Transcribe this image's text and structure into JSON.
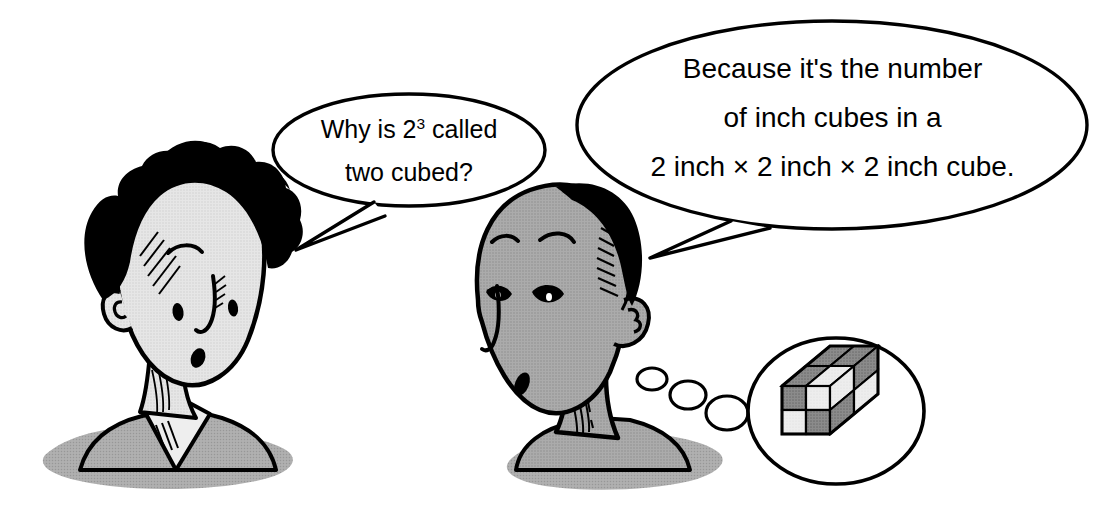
{
  "scene": {
    "title": "Two cubed cartoon explanation",
    "background_color": "#ffffff",
    "width": 1102,
    "height": 507
  },
  "palette": {
    "ink": "#000000",
    "paper": "#ffffff",
    "skin_light": "#e2e2e2",
    "skin_dark": "#a6a6a6",
    "shadow_gray": "#a8a8a8",
    "cube_dark": "#808080",
    "cube_light": "#e8e8e8",
    "cube_mid": "#b5b5b5"
  },
  "characters": [
    {
      "id": "left-boy",
      "name": "boy-with-dark-hair",
      "hair_color": "#000000",
      "skin_color": "#e2e2e2",
      "expression": "puzzled"
    },
    {
      "id": "right-boy",
      "name": "boy-with-short-hair",
      "hair_color": "#000000",
      "skin_color": "#a6a6a6",
      "expression": "explaining"
    }
  ],
  "speech_bubbles": [
    {
      "id": "left-bubble",
      "speaker": "left-boy",
      "lines": [
        "Why is 2³ called",
        "two cubed?"
      ],
      "line1_before_sup": "Why is 2",
      "line1_sup": "3",
      "line1_after_sup": " called",
      "line2": "two cubed?",
      "tail_direction": "down-left"
    },
    {
      "id": "right-bubble",
      "speaker": "right-boy",
      "lines": [
        "Because it's the number",
        "of inch cubes in a",
        "2 inch × 2 inch × 2 inch cube."
      ],
      "line1": "Because it's the number",
      "line2": "of inch cubes in a",
      "line3": "2 inch × 2 inch × 2 inch cube.",
      "tail_direction": "down-left"
    }
  ],
  "thought_bubble": {
    "id": "cube-thought",
    "thinker": "right-boy",
    "dots": 3,
    "content": "2x2x2-cube",
    "cube": {
      "edge_units": 2,
      "unit_cubes": 8,
      "label": "2 inch x 2 inch x 2 inch cube",
      "pattern": "checkerboard",
      "colors": {
        "dark": "#808080",
        "light": "#e8e8e8",
        "side": "#b5b5b5"
      }
    }
  }
}
